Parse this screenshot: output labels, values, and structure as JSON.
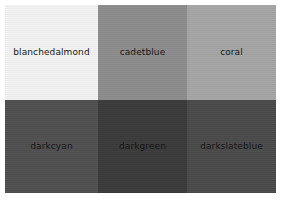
{
  "page": {
    "background_color": "#ffffff",
    "label_text_color": "#141414"
  },
  "grid": {
    "columns": 3,
    "rows": 2,
    "cells": [
      {
        "label": "blanchedalmond",
        "named_color": "blanchedalmond",
        "rendered_color": "#f2f2f2",
        "row": 1,
        "column": 1
      },
      {
        "label": "cadetblue",
        "named_color": "cadetblue",
        "rendered_color": "#8c8c8c",
        "row": 1,
        "column": 2
      },
      {
        "label": "coral",
        "named_color": "coral",
        "rendered_color": "#a5a5a5",
        "row": 1,
        "column": 3
      },
      {
        "label": "darkcyan",
        "named_color": "darkcyan",
        "rendered_color": "#4f4f4f",
        "row": 2,
        "column": 1
      },
      {
        "label": "darkgreen",
        "named_color": "darkgreen",
        "rendered_color": "#3a3a3a",
        "row": 2,
        "column": 2
      },
      {
        "label": "darkslateblue",
        "named_color": "darkslateblue",
        "rendered_color": "#4a4a4a",
        "row": 2,
        "column": 3
      }
    ]
  },
  "chart_data": {
    "type": "table",
    "title": "",
    "categories": [
      "blanchedalmond",
      "cadetblue",
      "coral",
      "darkcyan",
      "darkgreen",
      "darkslateblue"
    ],
    "values": [
      "#f2f2f2",
      "#8c8c8c",
      "#a5a5a5",
      "#4f4f4f",
      "#3a3a3a",
      "#4a4a4a"
    ],
    "xlabel": "",
    "ylabel": "",
    "legend": []
  }
}
